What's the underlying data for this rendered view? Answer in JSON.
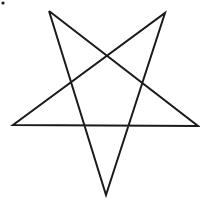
{
  "figure": {
    "width": 200,
    "height": 201,
    "background": "#ffffff",
    "stroke_color": "#1a1a1a",
    "stroke_width": 2,
    "dot": {
      "x": 3,
      "y": 3,
      "r": 1.6
    },
    "vertices": {
      "top_left": [
        49,
        11
      ],
      "top_right": [
        165,
        13
      ],
      "left": [
        13,
        125
      ],
      "right": [
        198,
        126
      ],
      "bottom": [
        106,
        195
      ]
    },
    "path_order": [
      "top_left",
      "bottom",
      "top_right",
      "left",
      "right",
      "top_left"
    ]
  }
}
